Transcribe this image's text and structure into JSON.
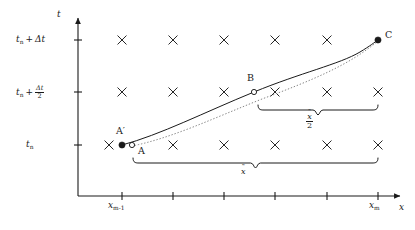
{
  "figure": {
    "kind": "semi-lagrangian-trajectory-diagram",
    "width": 415,
    "height": 230,
    "background": "#ffffff",
    "ink": "#1a1a1a"
  },
  "axes": {
    "x_axis_label": "x",
    "y_axis_label": "t",
    "origin": {
      "x": 78,
      "y": 196
    },
    "x_axis_end": {
      "x": 404,
      "y": 196
    },
    "y_axis_top": {
      "x": 78,
      "y": 14
    }
  },
  "y_ticks": [
    {
      "id": "t-n",
      "label_plain": "t_n",
      "y": 145
    },
    {
      "id": "t-n-half-dt",
      "label_plain": "t_n + Δt/2",
      "y": 92
    },
    {
      "id": "t-n-dt",
      "label_plain": "t_n + Δt",
      "y": 40
    }
  ],
  "y_tick_text": {
    "t_symbol": "t",
    "n_sub": "n",
    "plus": "+",
    "delta_t": "Δt",
    "frac_numerator": "Δt",
    "frac_denominator": "2"
  },
  "x_ticks": [
    {
      "id": "x-m-minus-1",
      "x": 122,
      "label_plain": "x_{m-1}",
      "labelled": true
    },
    {
      "id": "x-tick-2",
      "x": 173,
      "label_plain": "",
      "labelled": false
    },
    {
      "id": "x-tick-3",
      "x": 224,
      "label_plain": "",
      "labelled": false
    },
    {
      "id": "x-tick-4",
      "x": 275,
      "label_plain": "",
      "labelled": false
    },
    {
      "id": "x-tick-5",
      "x": 327,
      "label_plain": "",
      "labelled": false
    },
    {
      "id": "x-m",
      "x": 378,
      "label_plain": "x_m",
      "labelled": true
    }
  ],
  "x_tick_text": {
    "x_symbol": "x",
    "m_minus_1_sub": "m-1",
    "m_sub": "m"
  },
  "grid_crosses": {
    "size": 4.2,
    "rows": [
      {
        "row_id": "row-t-n-dt",
        "y": 40,
        "xs": [
          122,
          173,
          224,
          275,
          327
        ]
      },
      {
        "row_id": "row-t-n-half-dt",
        "y": 92,
        "xs": [
          122,
          173,
          224,
          275,
          327,
          378
        ]
      },
      {
        "row_id": "row-t-n",
        "y": 145,
        "xs": [
          109,
          173,
          224,
          275,
          327,
          378
        ]
      }
    ]
  },
  "points": [
    {
      "id": "A-prime",
      "label": "A′",
      "marker": "filled",
      "x": 122,
      "y": 145,
      "label_x": 116,
      "label_y": 129
    },
    {
      "id": "A",
      "label": "A",
      "marker": "open",
      "x": 132,
      "y": 145,
      "label_x": 138,
      "label_y": 149
    },
    {
      "id": "B",
      "label": "B",
      "marker": "open",
      "x": 254,
      "y": 92,
      "label_x": 247,
      "label_y": 76
    },
    {
      "id": "C",
      "label": "C",
      "marker": "filled",
      "x": 378,
      "y": 40,
      "label_x": 385,
      "label_y": 33
    }
  ],
  "curves": [
    {
      "id": "solid-trajectory",
      "style": "solid",
      "from": "A-prime",
      "to": "C",
      "path": "M 122 145 C 160 135, 205 112, 254 92 C 300 73, 340 64, 360 52 C 370 46, 375 42, 378 40"
    },
    {
      "id": "dotted-trajectory",
      "style": "dotted",
      "from": "A",
      "to": "C",
      "path": "M 132 146 C 172 138, 214 118, 262 99 C 310 81, 348 66, 378 41"
    }
  ],
  "braces": [
    {
      "id": "brace-x-tilde",
      "label_plain": "x̃",
      "from_x": 133,
      "to_x": 378,
      "y": 163,
      "label_x": 245,
      "label_y": 170,
      "direction": "down"
    },
    {
      "id": "brace-x-tilde-half",
      "label_plain": "x̃/2",
      "from_x": 258,
      "to_x": 378,
      "y": 110,
      "label_x": 311,
      "label_y": 117,
      "direction": "down"
    }
  ],
  "brace_text": {
    "x_symbol": "x",
    "tilde": "˜",
    "denominator": "2"
  }
}
